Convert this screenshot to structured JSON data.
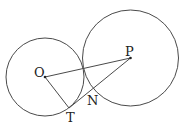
{
  "diagram": {
    "stroke_color": "#4a4a4a",
    "circles": [
      {
        "name": "circle-O",
        "cx": 45,
        "cy": 77,
        "r": 39
      },
      {
        "name": "circle-P",
        "cx": 130.5,
        "cy": 58,
        "r": 48
      }
    ],
    "segments": [
      {
        "name": "segment-OP",
        "from": "O",
        "to": "P"
      },
      {
        "name": "segment-OT",
        "from": "O",
        "to": "T"
      },
      {
        "name": "segment-TP",
        "from": "T",
        "to": "P"
      }
    ],
    "points": {
      "O": {
        "x": 45,
        "y": 77,
        "label": "O",
        "lx": 34,
        "ly": 77
      },
      "P": {
        "x": 130.5,
        "y": 58,
        "label": "P",
        "lx": 125,
        "ly": 56
      },
      "T": {
        "x": 69,
        "y": 108,
        "label": "T",
        "lx": 66,
        "ly": 122
      },
      "N": {
        "label": "N",
        "lx": 87,
        "ly": 105
      }
    }
  }
}
